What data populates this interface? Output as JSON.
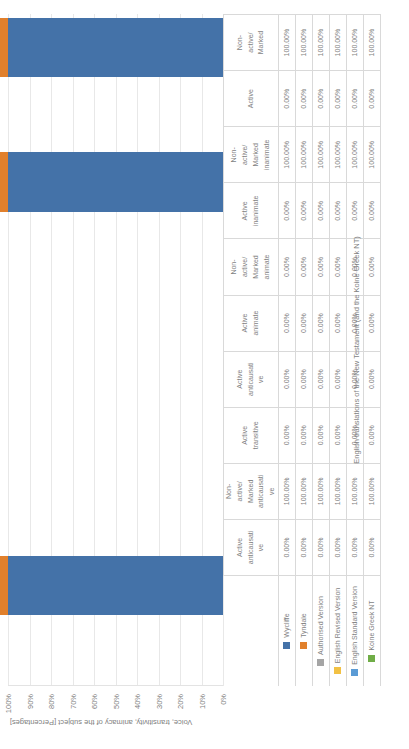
{
  "chart_data": {
    "type": "bar",
    "title": "",
    "xlabel": "English translations of the New Testament (and the Koine Greek NT)",
    "ylabel": "Voice, transitivity, animacy of the subject [Percentages]",
    "ylim": [
      0,
      100
    ],
    "ytick_labels": [
      "0%",
      "10%",
      "20%",
      "30%",
      "40%",
      "50%",
      "60%",
      "70%",
      "80%",
      "90%",
      "100%"
    ],
    "ytick_values": [
      0,
      10,
      20,
      30,
      40,
      50,
      60,
      70,
      80,
      90,
      100
    ],
    "grid": true,
    "legend_position": "table-row-labels",
    "stacked": true,
    "categories": [
      "Active anticausative",
      "Non-active/ Marked anticausative",
      "Active transitive",
      "Active anticausative",
      "Active animate",
      "Non-active/ Marked animate",
      "Active inanimate",
      "Non-active/ Marked inanimate",
      "Active",
      "Non-active/ Marked"
    ],
    "category_lines": [
      [
        "Active",
        "anticausati",
        "ve"
      ],
      [
        "Non-",
        "active/",
        "Marked",
        "anticausati",
        "ve"
      ],
      [
        "Active",
        "transitive"
      ],
      [
        "Active",
        "anticausati",
        "ve"
      ],
      [
        "Active",
        "animate"
      ],
      [
        "Non-",
        "active/",
        "Marked",
        "animate"
      ],
      [
        "Active",
        "inanimate"
      ],
      [
        "Non-",
        "active/",
        "Marked",
        "inanimate"
      ],
      [
        "Active"
      ],
      [
        "Non-",
        "active/",
        "Marked"
      ]
    ],
    "series": [
      {
        "name": "Wycliffe",
        "color": "#4472a8",
        "values": [
          0,
          100,
          0,
          0,
          0,
          0,
          0,
          100,
          0,
          100
        ],
        "labels": [
          "0.00%",
          "100.00%",
          "0.00%",
          "0.00%",
          "0.00%",
          "0.00%",
          "0.00%",
          "100.00%",
          "0.00%",
          "100.00%"
        ]
      },
      {
        "name": "Tyndale",
        "color": "#e1802c",
        "values": [
          0,
          100,
          0,
          0,
          0,
          0,
          0,
          100,
          0,
          100
        ],
        "labels": [
          "0.00%",
          "100.00%",
          "0.00%",
          "0.00%",
          "0.00%",
          "0.00%",
          "0.00%",
          "100.00%",
          "0.00%",
          "100.00%"
        ]
      },
      {
        "name": "Authorised Version",
        "color": "#a5a5a5",
        "values": [
          0,
          100,
          0,
          0,
          0,
          0,
          0,
          100,
          0,
          100
        ],
        "labels": [
          "0.00%",
          "100.00%",
          "0.00%",
          "0.00%",
          "0.00%",
          "0.00%",
          "0.00%",
          "100.00%",
          "0.00%",
          "100.00%"
        ]
      },
      {
        "name": "English Revised Version",
        "color": "#f2c144",
        "values": [
          0,
          100,
          0,
          0,
          0,
          0,
          0,
          100,
          0,
          100
        ],
        "labels": [
          "0.00%",
          "100.00%",
          "0.00%",
          "0.00%",
          "0.00%",
          "0.00%",
          "0.00%",
          "100.00%",
          "0.00%",
          "100.00%"
        ]
      },
      {
        "name": "English Standard Version",
        "color": "#5b9bd5",
        "values": [
          0,
          100,
          0,
          0,
          0,
          0,
          0,
          100,
          0,
          100
        ],
        "labels": [
          "0.00%",
          "100.00%",
          "0.00%",
          "0.00%",
          "0.00%",
          "0.00%",
          "0.00%",
          "100.00%",
          "0.00%",
          "100.00%"
        ]
      },
      {
        "name": "Koine Greek NT",
        "color": "#70ad47",
        "values": [
          0,
          100,
          0,
          0,
          0,
          0,
          0,
          100,
          0,
          100
        ],
        "labels": [
          "0.00%",
          "100.00%",
          "0.00%",
          "0.00%",
          "0.00%",
          "0.00%",
          "0.00%",
          "100.00%",
          "0.00%",
          "100.00%"
        ]
      }
    ]
  }
}
